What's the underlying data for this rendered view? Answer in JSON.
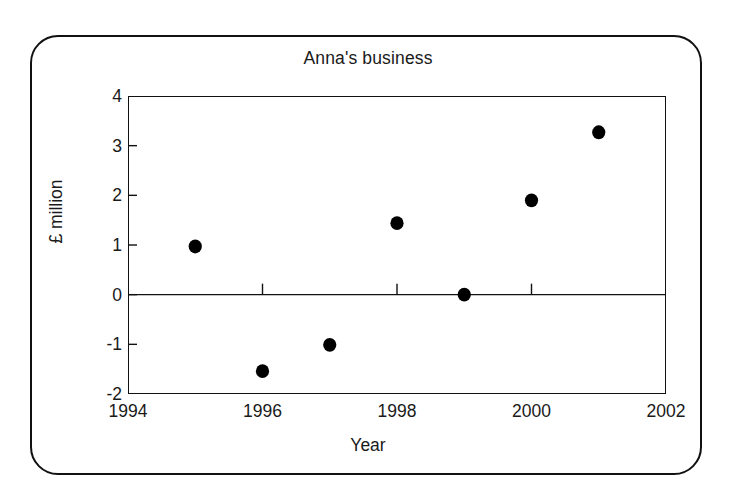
{
  "figure": {
    "title": "Anna's business",
    "background_color": "#ffffff",
    "frame_color": "#111111",
    "marker_color": "#000000"
  },
  "chart_data": {
    "type": "scatter",
    "title": "Anna's business",
    "xlabel": "Year",
    "ylabel": "£ million",
    "xlim": [
      1994,
      2002
    ],
    "ylim": [
      -2,
      4
    ],
    "xticks": [
      1994,
      1996,
      1998,
      2000,
      2002
    ],
    "xtick_labels": [
      "1994",
      "1996",
      "1998",
      "2000",
      "2002"
    ],
    "yticks": [
      -2,
      -1,
      0,
      1,
      2,
      3,
      4
    ],
    "ytick_labels": [
      "-2",
      "-1",
      "0",
      "1",
      "2",
      "3",
      "4"
    ],
    "grid": false,
    "legend": false,
    "zero_line": true,
    "x": [
      1995,
      1996,
      1997,
      1998,
      1999,
      2000,
      2001
    ],
    "y": [
      0.97,
      -1.54,
      -1.01,
      1.44,
      0.0,
      1.9,
      3.27
    ],
    "points": [
      {
        "year": 1995,
        "value": 0.97
      },
      {
        "year": 1996,
        "value": -1.54
      },
      {
        "year": 1997,
        "value": -1.01
      },
      {
        "year": 1998,
        "value": 1.44
      },
      {
        "year": 1999,
        "value": 0.0
      },
      {
        "year": 2000,
        "value": 1.9
      },
      {
        "year": 2001,
        "value": 3.27
      }
    ]
  }
}
